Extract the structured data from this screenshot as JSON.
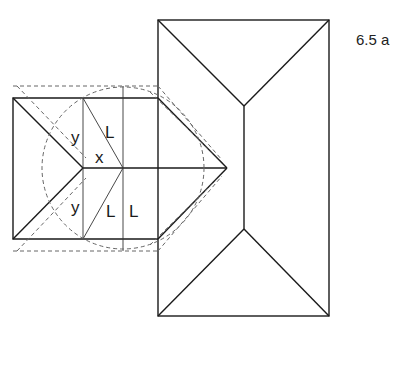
{
  "figure": {
    "number": "6.5 a"
  },
  "labels": {
    "y_top": "y",
    "L_top": "L",
    "x_mid": "x",
    "y_bottom": "y",
    "L_bottom_diag": "L",
    "L_bottom_vert": "L"
  },
  "colors": {
    "line": "#1a1a1a",
    "dashed": "#666666",
    "background": "#ffffff"
  }
}
